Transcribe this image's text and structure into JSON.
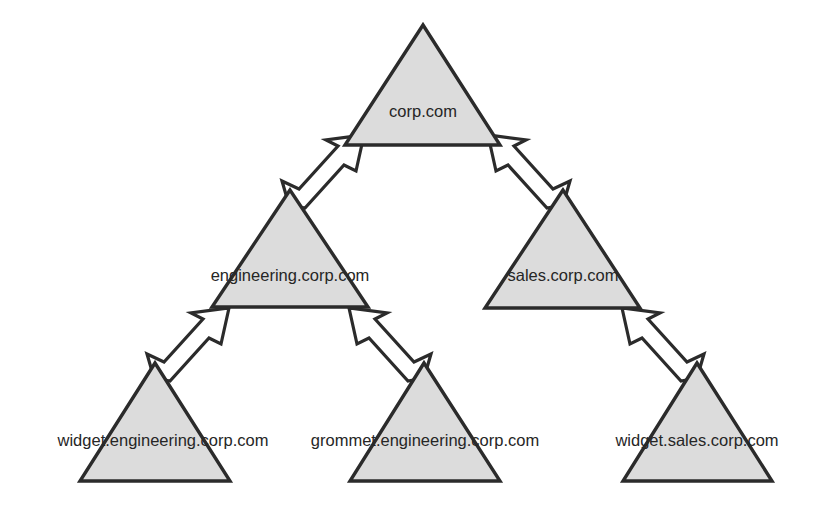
{
  "diagram": {
    "type": "domain-tree",
    "canvas": {
      "width": 826,
      "height": 516
    },
    "colors": {
      "triangle_fill": "#dcdcdc",
      "triangle_stroke": "#2b2b2b",
      "arrow_fill": "#ffffff",
      "arrow_stroke": "#2b2b2b",
      "label_text": "#262626",
      "background": "#ffffff"
    },
    "nodes": [
      {
        "id": "corp",
        "label": "corp.com",
        "level": 0,
        "parent": null,
        "label_x": 423,
        "label_y": 117,
        "apex_x": 423,
        "apex_y": 25,
        "base_y": 145,
        "base_left_x": 345,
        "base_right_x": 500
      },
      {
        "id": "engineering",
        "label": "engineering.corp.com",
        "level": 1,
        "parent": "corp",
        "label_x": 290,
        "label_y": 281,
        "apex_x": 290,
        "apex_y": 190,
        "base_y": 307,
        "base_left_x": 212,
        "base_right_x": 368
      },
      {
        "id": "sales",
        "label": "sales.corp.com",
        "level": 1,
        "parent": "corp",
        "label_x": 563,
        "label_y": 281,
        "apex_x": 563,
        "apex_y": 190,
        "base_y": 308,
        "base_left_x": 485,
        "base_right_x": 640
      },
      {
        "id": "widget-engineering",
        "label": "widget.engineering.corp.com",
        "level": 2,
        "parent": "engineering",
        "label_x": 163,
        "label_y": 446,
        "apex_x": 155,
        "apex_y": 363,
        "base_y": 481,
        "base_left_x": 80,
        "base_right_x": 230
      },
      {
        "id": "grommet-engineering",
        "label": "grommet.engineering.corp.com",
        "level": 2,
        "parent": "engineering",
        "label_x": 425,
        "label_y": 446,
        "apex_x": 424,
        "apex_y": 363,
        "base_y": 481,
        "base_left_x": 350,
        "base_right_x": 500
      },
      {
        "id": "widget-sales",
        "label": "widget.sales.corp.com",
        "level": 2,
        "parent": "sales",
        "label_x": 697,
        "label_y": 446,
        "apex_x": 697,
        "apex_y": 363,
        "base_y": 481,
        "base_left_x": 623,
        "base_right_x": 772
      }
    ],
    "edges": [
      {
        "id": "engineering-to-corp",
        "from": "engineering",
        "to": "corp",
        "direction": "up-right",
        "style": "block-arrow"
      },
      {
        "id": "sales-to-corp",
        "from": "sales",
        "to": "corp",
        "direction": "up-left",
        "style": "block-arrow"
      },
      {
        "id": "widget-engineering-to-engineering",
        "from": "widget-engineering",
        "to": "engineering",
        "direction": "up-right",
        "style": "block-arrow"
      },
      {
        "id": "grommet-engineering-to-engineering",
        "from": "grommet-engineering",
        "to": "engineering",
        "direction": "up-left",
        "style": "block-arrow"
      },
      {
        "id": "widget-sales-to-sales",
        "from": "widget-sales",
        "to": "sales",
        "direction": "up-left",
        "style": "block-arrow"
      }
    ]
  }
}
